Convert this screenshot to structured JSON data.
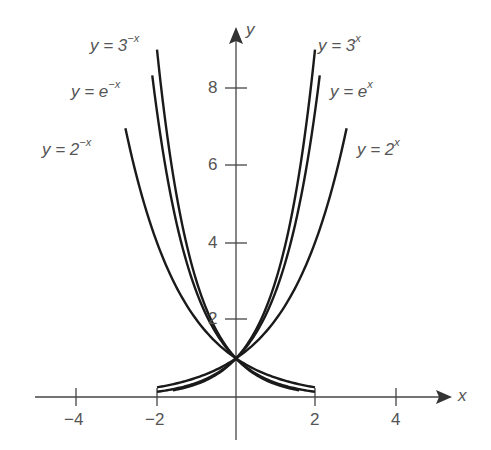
{
  "chart_data": {
    "type": "line",
    "title": "",
    "xlabel": "x",
    "ylabel": "y",
    "xlim": [
      -5,
      5.5
    ],
    "ylim": [
      -1.2,
      9.5
    ],
    "grid": false,
    "legend": "inline labels at curve ends",
    "x_ticks": [
      -4,
      -2,
      2,
      4
    ],
    "x_tick_labels": [
      "−4",
      "−2",
      "2",
      "4"
    ],
    "y_ticks": [
      2,
      4,
      6,
      8
    ],
    "y_tick_labels": [
      "2",
      "4",
      "6",
      "8"
    ],
    "series": [
      {
        "name": "y = 3^x",
        "base": 3,
        "sign": 1,
        "x_range": [
          -1.6,
          2.0
        ],
        "label_prefix": "y = 3",
        "label_exp": "x"
      },
      {
        "name": "y = e^x",
        "base": 2.718282,
        "sign": 1,
        "x_range": [
          -2.0,
          2.12
        ],
        "label_prefix": "y = e",
        "label_exp": "x"
      },
      {
        "name": "y = 2^x",
        "base": 2,
        "sign": 1,
        "x_range": [
          -2.0,
          2.8
        ],
        "label_prefix": "y = 2",
        "label_exp": "x"
      },
      {
        "name": "y = 3^-x",
        "base": 3,
        "sign": -1,
        "x_range": [
          -2.0,
          1.6
        ],
        "label_prefix": "y = 3",
        "label_exp": "−x"
      },
      {
        "name": "y = e^-x",
        "base": 2.718282,
        "sign": -1,
        "x_range": [
          -2.12,
          2.0
        ],
        "label_prefix": "y = e",
        "label_exp": "−x"
      },
      {
        "name": "y = 2^-x",
        "base": 2,
        "sign": -1,
        "x_range": [
          -2.8,
          2.0
        ],
        "label_prefix": "y = 2",
        "label_exp": "−x"
      }
    ],
    "annotations": [
      "All curves intersect at (0, 1)"
    ]
  },
  "labels": {
    "y3x": {
      "prefix": "y = 3",
      "exp": "x"
    },
    "yex": {
      "prefix": "y = e",
      "exp": "x"
    },
    "y2x": {
      "prefix": "y = 2",
      "exp": "x"
    },
    "y3nx": {
      "prefix": "y = 3",
      "exp": "−x"
    },
    "yenx": {
      "prefix": "y = e",
      "exp": "−x"
    },
    "y2nx": {
      "prefix": "y = 2",
      "exp": "−x"
    }
  },
  "axes": {
    "x_name": "x",
    "y_name": "y",
    "x_ticks": [
      "−4",
      "−2",
      "2",
      "4"
    ],
    "y_ticks": [
      "8",
      "6",
      "4",
      "2"
    ]
  },
  "style": {
    "curve_color": "#1a1a1a",
    "axis_color": "#444444",
    "text_color": "#555555"
  }
}
